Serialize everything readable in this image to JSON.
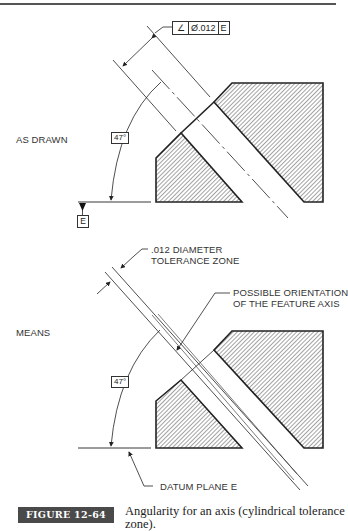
{
  "figure": {
    "number": "FIGURE 12-64",
    "caption": "Angularity for an axis (cylindrical tolerance zone).",
    "accent_color": "#4a4a4a"
  },
  "top_view": {
    "label": "AS DRAWN",
    "feature_control_frame": {
      "symbol": "angularity-icon",
      "symbol_glyph": "∠",
      "tolerance": "Ø.012",
      "datum": "E"
    },
    "angle": "47°",
    "datum_label": "E"
  },
  "bottom_view": {
    "label": "MEANS",
    "angle": "47°",
    "callouts": {
      "tolerance_zone": [
        ".012 DIAMETER",
        "TOLERANCE ZONE"
      ],
      "feature_axis": [
        "POSSIBLE ORIENTATION",
        "OF THE FEATURE AXIS"
      ],
      "datum_plane": "DATUM PLANE E"
    }
  }
}
